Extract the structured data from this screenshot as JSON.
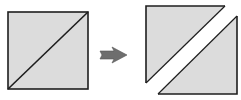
{
  "diagram": {
    "colors": {
      "fill": "#dcdcdc",
      "stroke": "#1e1e1e",
      "arrow": "#6e6e6e",
      "background": "#ffffff"
    },
    "before": {
      "label": "",
      "shape": "square-with-diagonal"
    },
    "arrow": {
      "icon": "right-arrow-icon"
    },
    "after": {
      "label": "",
      "shapes": [
        "upper-left-triangle",
        "lower-right-triangle"
      ]
    }
  }
}
